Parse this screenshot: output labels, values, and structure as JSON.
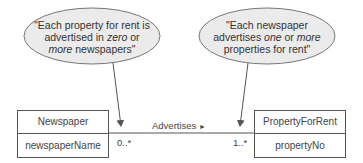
{
  "notes": {
    "left": {
      "line1": "\"Each property for rent is",
      "line2_a": "advertised in ",
      "line2_em": "zero",
      "line2_b": " or",
      "line3_em": "more",
      "line3_b": " newspapers\""
    },
    "right": {
      "line1": "\"Each newspaper",
      "line2_a": "advertises ",
      "line2_em1": "one",
      "line2_b": " or ",
      "line2_em2": "more",
      "line3": "properties for rent\""
    }
  },
  "classes": {
    "left": {
      "name": "Newspaper",
      "attribute": "newspaperName"
    },
    "right": {
      "name": "PropertyForRent",
      "attribute": "propertyNo"
    }
  },
  "association": {
    "name": "Advertises",
    "direction_glyph": "►",
    "left_multiplicity": "0..*",
    "right_multiplicity": "1..*"
  },
  "colors": {
    "note_fill": "#ebebeb",
    "line": "#555555"
  }
}
